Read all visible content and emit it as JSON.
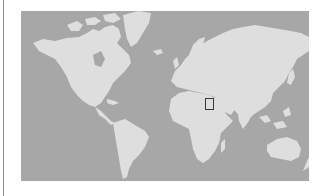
{
  "map": {
    "type": "world-locator-map",
    "projection": "mercator",
    "colors": {
      "ocean": "#a7a7a7",
      "land": "#dedede",
      "highlight_border": "#3a3a3a"
    },
    "highlight": {
      "region": "Arabian Peninsula (Yemen/Oman area)",
      "box_px": {
        "left": 205,
        "top": 98,
        "width": 9,
        "height": 12
      }
    }
  }
}
